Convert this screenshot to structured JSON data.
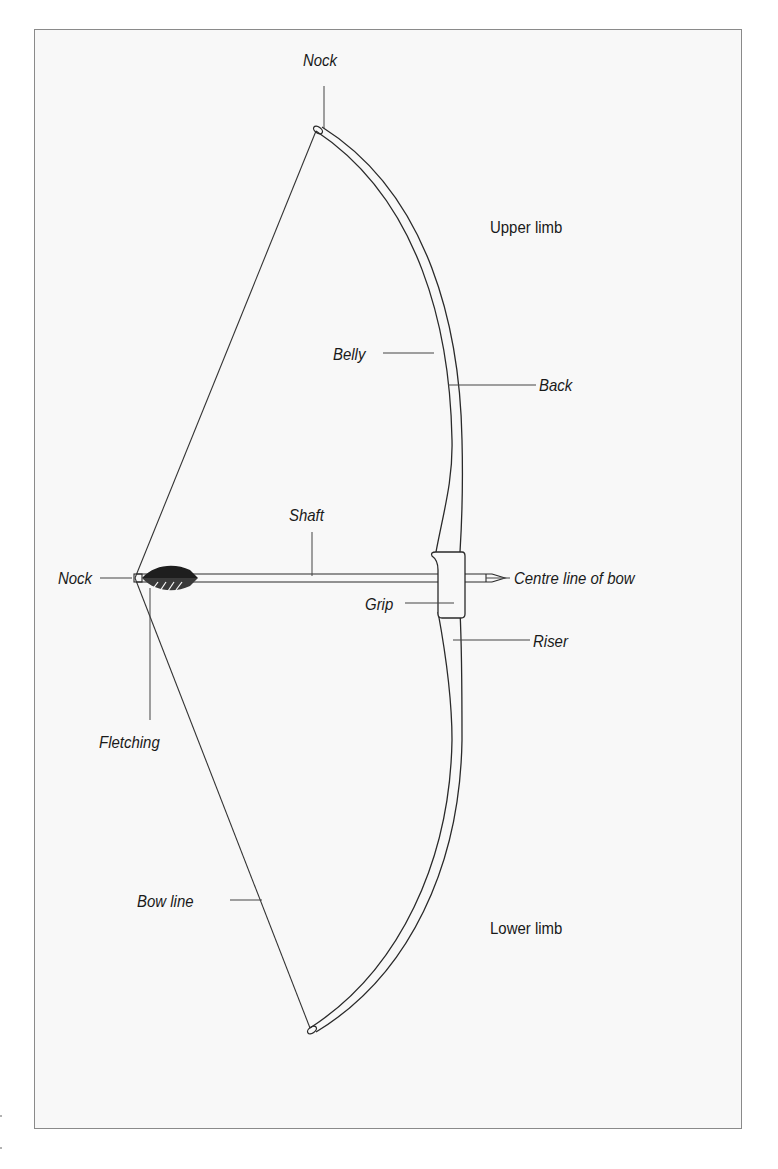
{
  "diagram": {
    "labels": {
      "nock_top": "Nock",
      "upper_limb": "Upper limb",
      "belly": "Belly",
      "back": "Back",
      "shaft": "Shaft",
      "nock_arrow": "Nock",
      "centre_line": "Centre line of bow",
      "grip": "Grip",
      "riser": "Riser",
      "fletching": "Fletching",
      "bow_line": "Bow line",
      "lower_limb": "Lower limb"
    },
    "colors": {
      "line": "#2a2a2a",
      "frame": "#8a8a8a",
      "background": "#f8f8f8"
    }
  }
}
